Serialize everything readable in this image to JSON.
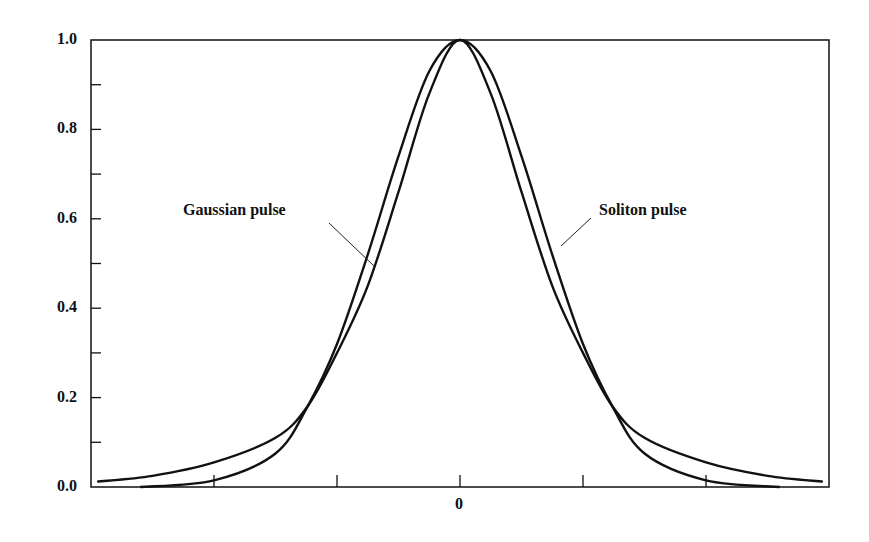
{
  "chart_data": {
    "type": "line",
    "title": "",
    "xlabel": "",
    "ylabel": "",
    "xlim": [
      -2.99,
      3.0
    ],
    "ylim": [
      0.0,
      1.0
    ],
    "x_ticks": [
      -2,
      -1,
      0,
      1,
      2
    ],
    "x_tick_labels": [
      "",
      "",
      "0",
      "",
      ""
    ],
    "y_ticks": [
      0.0,
      0.2,
      0.4,
      0.6,
      0.8,
      1.0
    ],
    "y_minor_ticks": [
      0.1,
      0.3,
      0.5,
      0.7,
      0.9
    ],
    "y_tick_labels": [
      "0.0",
      "0.2",
      "0.4",
      "0.6",
      "0.8",
      "1.0"
    ],
    "grid": false,
    "legend": "none (inline annotations)",
    "series": [
      {
        "name": "Gaussian pulse",
        "x": [
          -2.6,
          -2.0,
          -1.5,
          -1.24,
          -1.0,
          -0.75,
          -0.5,
          -0.25,
          0,
          0.25,
          0.5,
          0.75,
          1.0,
          1.24,
          1.5,
          2.0,
          2.6
        ],
        "values": [
          0.0,
          0.015,
          0.075,
          0.18,
          0.32,
          0.52,
          0.74,
          0.93,
          1.0,
          0.93,
          0.74,
          0.52,
          0.32,
          0.18,
          0.075,
          0.015,
          0.0
        ]
      },
      {
        "name": "Soliton pulse",
        "x": [
          -2.95,
          -2.5,
          -2.0,
          -1.5,
          -1.24,
          -1.0,
          -0.75,
          -0.5,
          -0.25,
          0,
          0.25,
          0.5,
          0.75,
          1.0,
          1.24,
          1.5,
          2.0,
          2.5,
          2.95
        ],
        "values": [
          0.012,
          0.025,
          0.055,
          0.11,
          0.18,
          0.3,
          0.45,
          0.66,
          0.88,
          1.0,
          0.88,
          0.66,
          0.45,
          0.3,
          0.18,
          0.11,
          0.055,
          0.025,
          0.012
        ]
      }
    ],
    "annotations": [
      {
        "text": "Gaussian pulse",
        "x": -0.72,
        "y": 0.6
      },
      {
        "text": "Soliton pulse",
        "x": 0.81,
        "y": 0.6
      }
    ]
  }
}
